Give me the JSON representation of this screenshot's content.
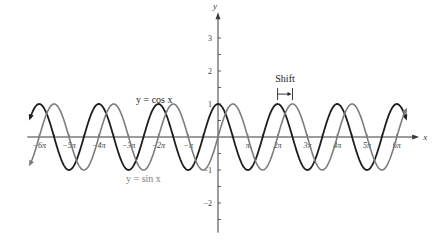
{
  "chart_data": {
    "type": "line",
    "title": "",
    "xlabel": "x",
    "ylabel": "y",
    "xlim_pi": [
      -6.4,
      6.55
    ],
    "ylim": [
      -2.9,
      3.6
    ],
    "x_ticks": [
      {
        "k": -6,
        "label": "−6π"
      },
      {
        "k": -5,
        "label": "−5π"
      },
      {
        "k": -4,
        "label": "−4π"
      },
      {
        "k": -3,
        "label": "−3π"
      },
      {
        "k": -2,
        "label": "−2π"
      },
      {
        "k": -1,
        "label": "−π"
      },
      {
        "k": 1,
        "label": "π"
      },
      {
        "k": 2,
        "label": "2π"
      },
      {
        "k": 3,
        "label": "3π"
      },
      {
        "k": 4,
        "label": "4π"
      },
      {
        "k": 5,
        "label": "5π"
      },
      {
        "k": 6,
        "label": "6π"
      }
    ],
    "x_minor_step_pi": 0.5,
    "y_ticks": [
      {
        "v": 3,
        "label": "3"
      },
      {
        "v": 2,
        "label": "2"
      },
      {
        "v": 1,
        "label": "1"
      },
      {
        "v": -1,
        "label": "−1"
      },
      {
        "v": -2,
        "label": "−2"
      }
    ],
    "y_minor_step": 0.5,
    "series": [
      {
        "name": "y = cos x",
        "function": "cos",
        "phase_pi": 0,
        "amplitude": 1,
        "period_pi": 2,
        "domain_pi": [
          -6.3,
          6.3
        ],
        "color": "#1e1e1e",
        "label_text": "y = cos x"
      },
      {
        "name": "y = sin x",
        "function": "sin",
        "phase_pi": 0.5,
        "amplitude": 1,
        "period_pi": 2,
        "domain_pi": [
          -6.3,
          6.3
        ],
        "color": "#7d7d7d",
        "label_text": "y = sin x"
      }
    ],
    "annotation": {
      "text": "Shift",
      "from_pi": 2,
      "to_pi": 2.5,
      "y": 1.3
    }
  }
}
